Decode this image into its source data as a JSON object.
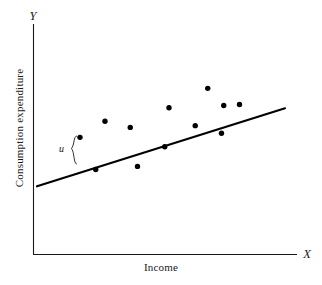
{
  "chart_data": {
    "type": "scatter",
    "title": "",
    "subtitle": "",
    "xlabel": "Income",
    "ylabel": "Consumption expenditure",
    "x_axis_symbol": "X",
    "y_axis_symbol": "Y",
    "grid": false,
    "legend": null,
    "axis_ticks": [],
    "xlim": [
      0,
      100
    ],
    "ylim": [
      0,
      100
    ],
    "points_label": "observed consumption-income pairs",
    "points": [
      {
        "x": 18.0,
        "y": 55.8
      },
      {
        "x": 24.3,
        "y": 37.4
      },
      {
        "x": 28.0,
        "y": 65.0
      },
      {
        "x": 38.1,
        "y": 61.5
      },
      {
        "x": 41.0,
        "y": 39.2
      },
      {
        "x": 51.9,
        "y": 50.4
      },
      {
        "x": 53.6,
        "y": 72.7
      },
      {
        "x": 64.1,
        "y": 62.5
      },
      {
        "x": 69.1,
        "y": 83.8
      },
      {
        "x": 74.6,
        "y": 58.1
      },
      {
        "x": 75.5,
        "y": 74.0
      },
      {
        "x": 81.8,
        "y": 74.6
      }
    ],
    "fit_line": {
      "name": "population regression line",
      "x_start": 0.8,
      "y_start": 27.8,
      "x_end": 100.0,
      "y_end": 72.4
    },
    "annotations": [
      {
        "name": "residual-brace",
        "label": "u",
        "description": "brace marking the vertical distance u between an observed point and the regression line",
        "x": 18.0,
        "y_top": 55.8,
        "y_bottom": 37.0
      }
    ]
  },
  "figure": {
    "caption": "",
    "axis_x_symbol": "X",
    "axis_y_symbol": "Y",
    "axis_x_title": "Income",
    "axis_y_title": "Consumption expenditure",
    "residual_symbol": "u"
  },
  "colors": {
    "background": "#ffffff",
    "axis": "#1a1a1a",
    "line": "#000000",
    "point": "#000000",
    "text": "#1a1a1a"
  }
}
